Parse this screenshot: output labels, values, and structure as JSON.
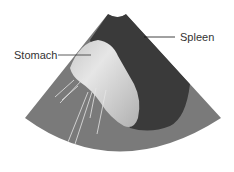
{
  "diagram": {
    "type": "ultrasound-sector",
    "labels": {
      "stomach": "Stomach",
      "spleen": "Spleen"
    },
    "colors": {
      "background": "#ffffff",
      "sector_tissue": "#7a7a7a",
      "spleen": "#3a3a3a",
      "stomach_light": "#e2e2e2",
      "stomach_mid": "#b8b8b8",
      "leader_line": "#333333",
      "reverberation_lines": "#e8e8e8"
    }
  }
}
